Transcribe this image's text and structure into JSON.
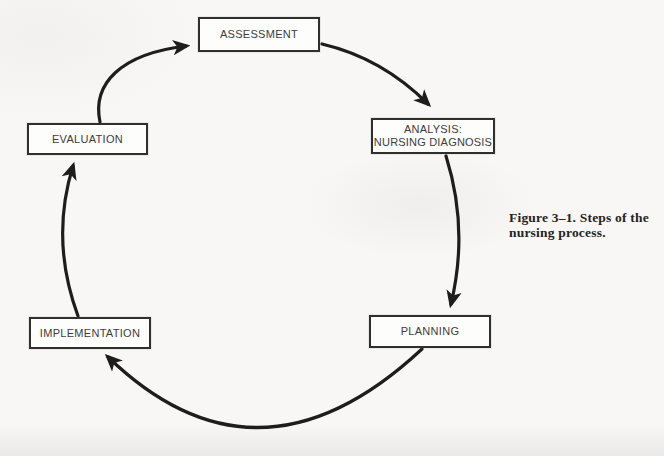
{
  "page": {
    "background_color": "#f8f7f5"
  },
  "caption": {
    "lines": [
      "Figure 3–1. Steps of the",
      "nursing process."
    ]
  },
  "diagram": {
    "type": "cycle",
    "direction": "clockwise",
    "nodes": [
      {
        "id": "assessment",
        "label": "ASSESSMENT"
      },
      {
        "id": "analysis",
        "label": "ANALYSIS:",
        "label_line2": "NURSING DIAGNOSIS"
      },
      {
        "id": "planning",
        "label": "PLANNING"
      },
      {
        "id": "implementation",
        "label": "IMPLEMENTATION"
      },
      {
        "id": "evaluation",
        "label": "EVALUATION"
      }
    ],
    "edges": [
      {
        "from": "assessment",
        "to": "analysis"
      },
      {
        "from": "analysis",
        "to": "planning"
      },
      {
        "from": "planning",
        "to": "implementation"
      },
      {
        "from": "implementation",
        "to": "evaluation"
      },
      {
        "from": "evaluation",
        "to": "assessment"
      }
    ],
    "colors": {
      "arrow": "#1d1d1d",
      "box_border": "#2f2f2f",
      "box_fill": "#fdfdfc",
      "label_text": "#3c3c3c",
      "caption_text": "#242424"
    }
  }
}
